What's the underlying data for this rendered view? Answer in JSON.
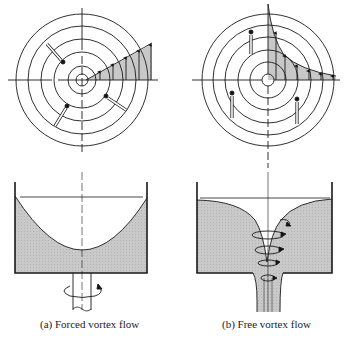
{
  "figure": {
    "panels": [
      {
        "id": "a",
        "caption": "(a) Forced vortex flow",
        "type": "forced"
      },
      {
        "id": "b",
        "caption": "(b) Free vortex flow",
        "type": "free"
      }
    ],
    "colors": {
      "line": "#1a1a1a",
      "fill": "#c8c8c8",
      "background": "#ffffff"
    }
  }
}
